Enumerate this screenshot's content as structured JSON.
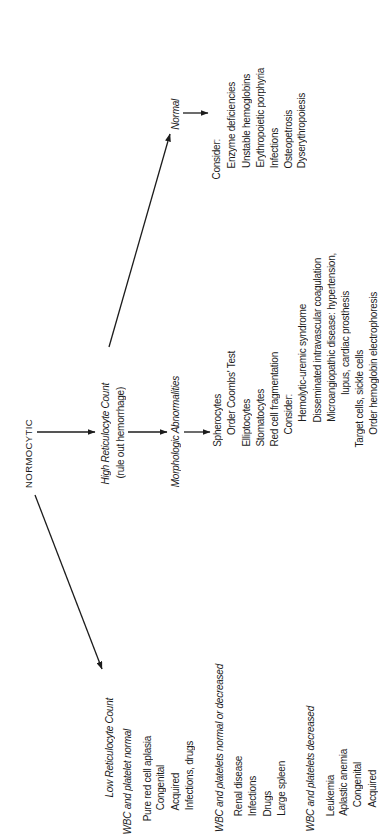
{
  "diagram": {
    "root": {
      "label": "NORMOCYTIC"
    },
    "high_retic": {
      "title": "High Reticulocyte Count",
      "subtitle": "(rule out hemorrhage)",
      "normal": {
        "label": "Normal",
        "consider_label": "Consider:",
        "items": [
          "Enzyme deficiencies",
          "Unstable hemoglobins",
          "Erythropoietic porphyria",
          "Infections",
          "Osteopetrosis",
          "Dyserythropoiesis"
        ]
      },
      "morphologic": {
        "label": "Morphologic Abnormalities",
        "lines": [
          "Spherocytes",
          "Order Coombs' Test",
          "Elliptocytes",
          "Stomatocytes",
          "Red cell fragmentation",
          "Consider:",
          "Hemolytic-uremic syndrome",
          "Disseminated intravascular coagulation",
          "Microangiopathic disease: hypertension,",
          "lupus, cardiac prosthesis",
          "Target cells, sickle cells",
          "Order hemoglobin electrophoresis"
        ]
      }
    },
    "low_retic": {
      "title": "Low Reticulocyte Count",
      "groups": [
        {
          "heading": "WBC and platelet normal",
          "lines": [
            "Pure red cell aplasia",
            "Congenital",
            "Acquired",
            "Infections, drugs"
          ]
        },
        {
          "heading": "WBC and platelets normal or decreased",
          "lines": [
            "Renal disease",
            "Infections",
            "Drugs",
            "Large spleen"
          ]
        },
        {
          "heading": "WBC and platelets decreased",
          "lines": [
            "Leukemia",
            "Aplastic anemia",
            "Congenital",
            "Acquired"
          ]
        }
      ]
    }
  },
  "colors": {
    "ink": "#1c1c1c",
    "background": "#ffffff"
  }
}
